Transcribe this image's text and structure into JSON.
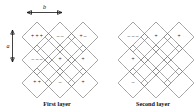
{
  "figure": {
    "background_color": "#ffffff",
    "line_color": "#7a7a7a",
    "text_color": "#111111"
  },
  "axes": {
    "horizontal": {
      "label": "b",
      "icon": "double-headed-horizontal-arrow",
      "orientation": "horizontal"
    },
    "vertical": {
      "label": "a",
      "icon": "double-headed-vertical-arrow",
      "orientation": "vertical"
    }
  },
  "panels": [
    {
      "id": "first-layer",
      "caption": "First layer",
      "grid": {
        "rows": 3,
        "cols": 3,
        "cell_shape": "diamond"
      },
      "cells": [
        {
          "row": 0,
          "col": 0,
          "signs": "+ + +"
        },
        {
          "row": 0,
          "col": 1,
          "signs": "–  –"
        },
        {
          "row": 0,
          "col": 2,
          "signs": "+  –"
        },
        {
          "row": 1,
          "col": 0,
          "signs": "– – –"
        },
        {
          "row": 1,
          "col": 1,
          "signs": "+"
        },
        {
          "row": 1,
          "col": 2,
          "signs": "+"
        },
        {
          "row": 2,
          "col": 0,
          "signs": "+ +"
        },
        {
          "row": 2,
          "col": 1,
          "signs": "–"
        },
        {
          "row": 2,
          "col": 2,
          "signs": "+"
        }
      ]
    },
    {
      "id": "second-layer",
      "caption": "Second layer",
      "grid": {
        "rows": 3,
        "cols": 3,
        "cell_shape": "diamond"
      },
      "cells": [
        {
          "row": 0,
          "col": 0,
          "signs": "– – –"
        },
        {
          "row": 0,
          "col": 1,
          "signs": "+"
        },
        {
          "row": 0,
          "col": 2,
          "signs": "+"
        },
        {
          "row": 1,
          "col": 0,
          "signs": "+"
        },
        {
          "row": 1,
          "col": 1,
          "signs": ""
        },
        {
          "row": 1,
          "col": 2,
          "signs": ""
        },
        {
          "row": 2,
          "col": 0,
          "signs": "–"
        },
        {
          "row": 2,
          "col": 1,
          "signs": ""
        },
        {
          "row": 2,
          "col": 2,
          "signs": ""
        }
      ]
    }
  ]
}
